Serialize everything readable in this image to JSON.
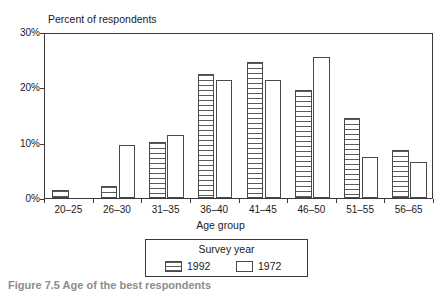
{
  "chart_data": {
    "type": "bar",
    "title": "",
    "ylabel": "Percent of respondents",
    "xlabel": "Age group",
    "ylim": [
      0,
      30
    ],
    "yticks": [
      0,
      10,
      20,
      30
    ],
    "ytick_labels": [
      "0%",
      "10%",
      "20%",
      "30%"
    ],
    "grid": false,
    "legend_position": "below-center",
    "legend_title": "Survey year",
    "categories": [
      "20–25",
      "26–30",
      "31–35",
      "36–40",
      "41–45",
      "46–50",
      "51–55",
      "56–65"
    ],
    "series": [
      {
        "name": "1992",
        "fill": "horizontal-hatch",
        "values": [
          1.5,
          2.2,
          10.2,
          22.5,
          24.5,
          19.5,
          14.5,
          8.7
        ]
      },
      {
        "name": "1972",
        "fill": "white",
        "values": [
          0.0,
          9.5,
          11.3,
          21.3,
          21.3,
          25.4,
          7.4,
          6.5
        ]
      }
    ]
  },
  "caption": {
    "text": "Figure 7.5  Age of the best respondents"
  },
  "colors": {
    "axis": "#3a3a3a",
    "bar_outline": "#4a4a4a",
    "hatch": "#5a5a5a",
    "background": "#ffffff",
    "text": "#1a1a1a"
  }
}
